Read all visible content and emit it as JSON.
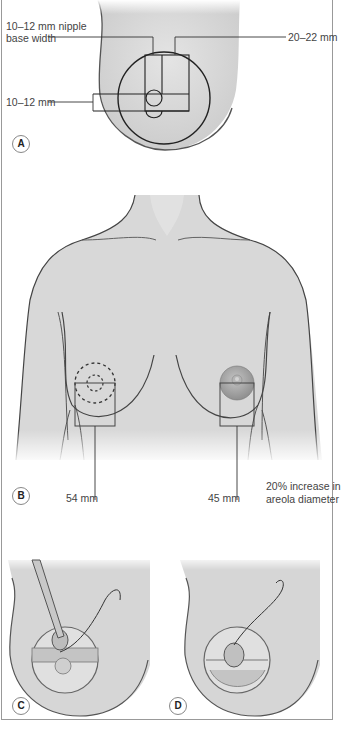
{
  "panel_a": {
    "badge": "A",
    "label_nipple_line1": "10–12 mm nipple",
    "label_nipple_line2": "base width",
    "label_areola": "20–22 mm",
    "label_height": "10–12 mm"
  },
  "panel_b": {
    "badge": "B",
    "label_left": "54 mm",
    "label_right": "45 mm",
    "note_line1": "20% increase in",
    "note_line2": "areola diameter"
  },
  "panel_c": {
    "badge": "C"
  },
  "panel_d": {
    "badge": "D"
  },
  "colors": {
    "skin": "#d9d9d9",
    "outline": "#444444",
    "line": "#333333",
    "areola": "#a8a8a8",
    "background": "#ffffff"
  }
}
